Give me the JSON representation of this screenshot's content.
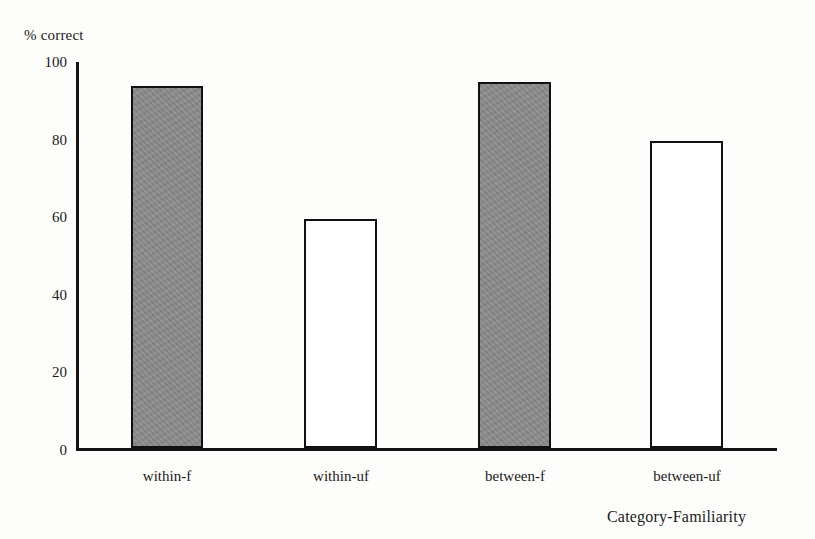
{
  "chart_data": {
    "type": "bar",
    "title": "",
    "subtitle": "",
    "xlabel": "Category-Familiarity",
    "ylabel": "% correct",
    "categories": [
      "within-f",
      "within-uf",
      "between-f",
      "between-uf"
    ],
    "values": [
      93,
      59,
      94,
      79
    ],
    "series": [
      {
        "name": "% correct",
        "values": [
          93,
          59,
          94,
          79
        ],
        "bar_styles": [
          "filled",
          "open",
          "filled",
          "open"
        ]
      }
    ],
    "ylim": [
      0,
      100
    ],
    "yticks": [
      0,
      20,
      40,
      60,
      80,
      100
    ],
    "ytick_labels": [
      "0",
      "20",
      "40",
      "60",
      "80",
      "100"
    ],
    "grid": false,
    "legend": "none",
    "bar_fill_gray": "#8a8a8a",
    "bar_fill_open": "#ffffff",
    "axis_color": "#141414",
    "background": "#fdfdfb"
  },
  "axis": {
    "y_title": "% correct",
    "x_title": "Category-Familiarity"
  }
}
